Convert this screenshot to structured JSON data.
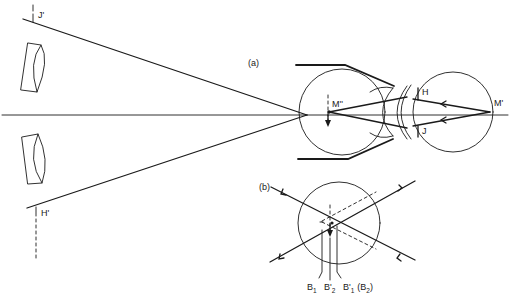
{
  "diagram": {
    "panel_a": {
      "label": "(a)",
      "points": {
        "j_prime": "J'",
        "h_prime": "H'",
        "m_double_prime": "M''",
        "m_prime": "M'",
        "h": "H",
        "j": "J"
      }
    },
    "panel_b": {
      "label": "(b)",
      "points": {
        "b1": "B",
        "b1_sub": "1",
        "b2_prime": "B'",
        "b2_prime_sub": "2",
        "b1_prime": "B'",
        "b1_prime_sub": "1",
        "b2_paren_open": "(B",
        "b2_sub": "2",
        "b2_paren_close": ")"
      }
    },
    "colors": {
      "stroke": "#1a1a1a",
      "background": "#ffffff"
    }
  }
}
